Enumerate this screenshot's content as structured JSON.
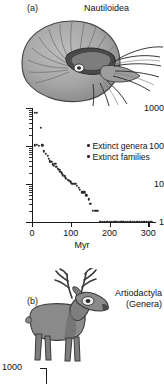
{
  "figure": {
    "panel_a": {
      "tag": "(a)",
      "title": "Nautiloidea",
      "illustration": "nautilus-shell-illustration"
    },
    "panel_b": {
      "tag": "(b)",
      "title_line1": "Artiodactyla",
      "title_line2": "(Genera)",
      "illustration": "deer-illustration"
    },
    "bottom_chart": {
      "y_top_label": "1000"
    }
  },
  "chart_data": {
    "type": "scatter",
    "title": "Nautiloidea",
    "xlabel": "Myr",
    "ylabel": "",
    "xlim": [
      0,
      320
    ],
    "ylim": [
      1,
      1000
    ],
    "yscale": "log",
    "grid": false,
    "legend_position": "upper-right",
    "xticks": [
      0,
      100,
      200,
      300
    ],
    "xtick_labels": [
      "0",
      "100",
      "200",
      "300"
    ],
    "yticks": [
      1,
      10,
      100,
      1000
    ],
    "ytick_labels": [
      "1",
      "10",
      "100",
      "1000"
    ],
    "series": [
      {
        "name": "Extinct genera",
        "marker": "dot",
        "color": "#2b2b2b",
        "points": [
          [
            8,
            760
          ],
          [
            13,
            750
          ],
          [
            22,
            300
          ],
          [
            8,
            105
          ],
          [
            12,
            108
          ],
          [
            18,
            100
          ],
          [
            27,
            105
          ],
          [
            31,
            72
          ],
          [
            36,
            62
          ],
          [
            40,
            55
          ],
          [
            44,
            46
          ],
          [
            46,
            40
          ],
          [
            50,
            38
          ],
          [
            54,
            33
          ],
          [
            57,
            30
          ],
          [
            60,
            34
          ],
          [
            63,
            28
          ],
          [
            66,
            25
          ],
          [
            70,
            24
          ],
          [
            73,
            21
          ],
          [
            77,
            19
          ],
          [
            80,
            17
          ],
          [
            84,
            16
          ],
          [
            88,
            14
          ],
          [
            92,
            13
          ],
          [
            96,
            12
          ],
          [
            100,
            11
          ],
          [
            104,
            10
          ],
          [
            108,
            10
          ],
          [
            112,
            10
          ],
          [
            116,
            9
          ],
          [
            120,
            8
          ],
          [
            124,
            7
          ],
          [
            128,
            6
          ],
          [
            132,
            6
          ],
          [
            136,
            6
          ],
          [
            140,
            5
          ],
          [
            146,
            4
          ],
          [
            150,
            3
          ],
          [
            157,
            2
          ],
          [
            163,
            2
          ],
          [
            169,
            2
          ]
        ]
      },
      {
        "name": "Extinct families",
        "marker": "dot",
        "color": "#2b2b2b",
        "points": [
          [
            176,
            1
          ],
          [
            182,
            1
          ],
          [
            188,
            1
          ],
          [
            194,
            1
          ],
          [
            200,
            1
          ],
          [
            206,
            1
          ],
          [
            212,
            1
          ],
          [
            218,
            1
          ],
          [
            224,
            1
          ],
          [
            230,
            1
          ],
          [
            236,
            1
          ],
          [
            242,
            1
          ],
          [
            248,
            1
          ],
          [
            254,
            1
          ],
          [
            260,
            1
          ],
          [
            266,
            1
          ],
          [
            272,
            1
          ],
          [
            278,
            1
          ],
          [
            284,
            1
          ],
          [
            290,
            1
          ],
          [
            296,
            1
          ],
          [
            302,
            1
          ],
          [
            308,
            1
          ]
        ]
      }
    ],
    "legend": [
      "Extinct genera",
      "Extinct families"
    ]
  }
}
